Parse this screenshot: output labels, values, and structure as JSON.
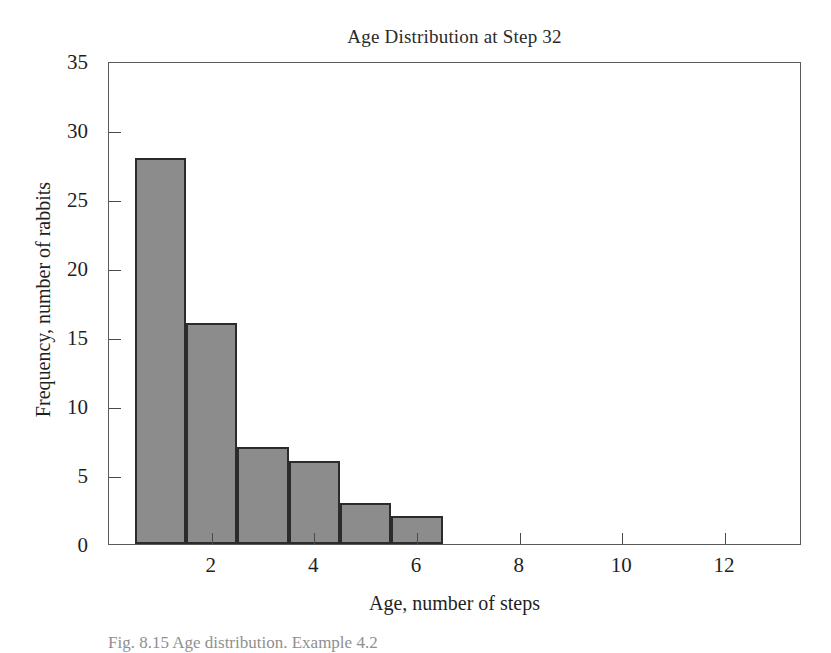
{
  "chart_data": {
    "type": "bar",
    "title": "Age Distribution at Step 32",
    "xlabel": "Age, number of steps",
    "ylabel": "Frequency, number of rabbits",
    "categories": [
      1,
      2,
      3,
      4,
      5,
      6
    ],
    "values": [
      28,
      16,
      7,
      6,
      3,
      2
    ],
    "bar_edges": [
      [
        0.5,
        1.5
      ],
      [
        1.5,
        2.5
      ],
      [
        2.5,
        3.5
      ],
      [
        3.5,
        4.5
      ],
      [
        4.5,
        5.5
      ],
      [
        5.5,
        6.5
      ]
    ],
    "xlim": [
      0.0,
      13.5
    ],
    "ylim": [
      0,
      35
    ],
    "xticks": [
      2,
      4,
      6,
      8,
      10,
      12
    ],
    "xtick_labels": [
      "2",
      "4",
      "6",
      "8",
      "10",
      "12"
    ],
    "yticks": [
      0,
      5,
      10,
      15,
      20,
      25,
      30,
      35
    ],
    "ytick_labels": [
      "0",
      "5",
      "10",
      "15",
      "20",
      "25",
      "30",
      "35"
    ],
    "grid": false,
    "legend": null,
    "bar_fill_color": "#8c8c8c",
    "bar_edge_color": "#2b2b2b",
    "frame_color": "#5a5a5a",
    "background_color": "#ffffff"
  },
  "caption": {
    "text": "Fig. 8.15  Age distribution. Example 4.2"
  }
}
